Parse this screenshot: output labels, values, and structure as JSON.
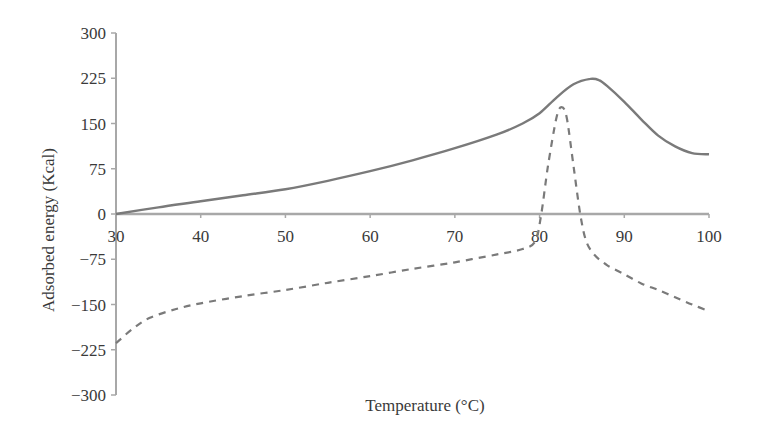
{
  "chart_data": {
    "type": "line",
    "title": "",
    "xlabel": "Temperature (°C)",
    "ylabel": "Adsorbed energy (Kcal)",
    "xlim": [
      30,
      100
    ],
    "ylim": [
      -300,
      300
    ],
    "x_ticks": [
      30,
      40,
      50,
      60,
      70,
      80,
      90,
      100
    ],
    "y_ticks": [
      300,
      225,
      150,
      75,
      0,
      -75,
      -150,
      -225,
      -300
    ],
    "y_tick_labels": [
      "300",
      "225",
      "150",
      "75",
      "0",
      "−75",
      "−150",
      "−225",
      "−300"
    ],
    "grid": false,
    "legend": null,
    "series": [
      {
        "name": "solid",
        "style": "solid",
        "color": "#7a7a7a",
        "x": [
          30,
          35,
          40,
          45,
          50,
          55,
          60,
          65,
          70,
          75,
          78,
          80,
          82,
          84,
          86,
          87,
          88,
          90,
          92,
          94,
          96,
          98,
          100
        ],
        "y": [
          0,
          11,
          21,
          31,
          41,
          55,
          71,
          89,
          109,
          132,
          150,
          167,
          193,
          215,
          224,
          222,
          212,
          186,
          157,
          130,
          112,
          101,
          99
        ]
      },
      {
        "name": "dashed",
        "style": "dashed",
        "color": "#7a7a7a",
        "x": [
          30,
          32,
          34,
          37,
          40,
          45,
          50,
          55,
          60,
          65,
          70,
          75,
          78,
          79.5,
          80.2,
          81,
          82,
          82.6,
          83.2,
          84,
          84.8,
          85.5,
          86.5,
          88,
          90,
          92,
          94,
          96,
          98,
          100
        ],
        "y": [
          -214,
          -190,
          -172,
          -158,
          -148,
          -136,
          -126,
          -114,
          -103,
          -91,
          -80,
          -67,
          -58,
          -45,
          0,
          80,
          160,
          177,
          160,
          80,
          0,
          -45,
          -68,
          -85,
          -100,
          -115,
          -126,
          -138,
          -150,
          -161
        ]
      }
    ]
  }
}
